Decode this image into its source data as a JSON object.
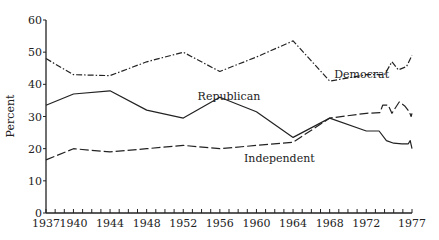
{
  "chart_data": {
    "type": "line",
    "title": "",
    "xlabel": "",
    "ylabel": "Percent",
    "ylim": [
      0,
      60
    ],
    "xlim": [
      1937,
      1977
    ],
    "y_ticks": [
      0,
      10,
      20,
      30,
      40,
      50,
      60
    ],
    "x_tick_labels": [
      "1937",
      "1940",
      "1944",
      "1948",
      "1952",
      "1956",
      "1960",
      "1964",
      "1968",
      "1972",
      "1977"
    ],
    "x_tick_values": [
      1937,
      1940,
      1944,
      1948,
      1952,
      1956,
      1960,
      1964,
      1968,
      1972,
      1977
    ],
    "grid": false,
    "legend": "inline labels",
    "series": [
      {
        "name": "Democrat",
        "style": "dash-dot",
        "label_pos": {
          "x": 1971.5,
          "y": 42
        },
        "points": [
          [
            1937,
            48
          ],
          [
            1940,
            43
          ],
          [
            1944,
            42.7
          ],
          [
            1948,
            47
          ],
          [
            1952,
            50
          ],
          [
            1956,
            44
          ],
          [
            1960,
            48.5
          ],
          [
            1964,
            53.5
          ],
          [
            1968,
            41
          ],
          [
            1972,
            43
          ],
          [
            1974,
            43
          ],
          [
            1974.8,
            47
          ],
          [
            1975.5,
            44.5
          ],
          [
            1976.4,
            45.5
          ],
          [
            1977,
            49
          ]
        ]
      },
      {
        "name": "Republican",
        "style": "solid",
        "label_pos": {
          "x": 1957,
          "y": 35
        },
        "points": [
          [
            1937,
            33.5
          ],
          [
            1940,
            37
          ],
          [
            1944,
            38
          ],
          [
            1948,
            32
          ],
          [
            1952,
            29.5
          ],
          [
            1956,
            36
          ],
          [
            1960,
            31.5
          ],
          [
            1964,
            23.5
          ],
          [
            1968,
            29.5
          ],
          [
            1972,
            25.5
          ],
          [
            1973.4,
            25.5
          ],
          [
            1974.2,
            22.5
          ],
          [
            1975,
            21.7
          ],
          [
            1975.9,
            21.5
          ],
          [
            1976.6,
            21.5
          ],
          [
            1976.8,
            22.5
          ],
          [
            1977,
            20
          ]
        ]
      },
      {
        "name": "Independent",
        "style": "long-dash",
        "label_pos": {
          "x": 1962.5,
          "y": 16
        },
        "points": [
          [
            1937,
            16.5
          ],
          [
            1940,
            20
          ],
          [
            1944,
            19
          ],
          [
            1948,
            20
          ],
          [
            1952,
            21
          ],
          [
            1956,
            20
          ],
          [
            1960,
            21
          ],
          [
            1964,
            22
          ],
          [
            1968,
            29.5
          ],
          [
            1972,
            31
          ],
          [
            1973.5,
            31.2
          ],
          [
            1973.8,
            33.5
          ],
          [
            1974.4,
            33.5
          ],
          [
            1974.8,
            31
          ],
          [
            1975.6,
            34.5
          ],
          [
            1976.2,
            33.3
          ],
          [
            1976.7,
            31.5
          ],
          [
            1976.9,
            30
          ],
          [
            1977,
            31
          ]
        ]
      }
    ]
  }
}
